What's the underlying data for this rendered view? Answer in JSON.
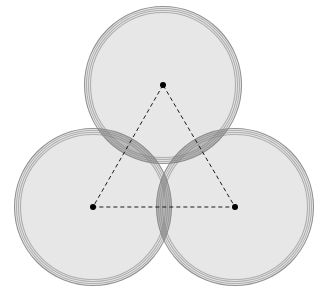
{
  "figure": {
    "type": "geometric-diagram",
    "canvas": {
      "width": 320,
      "height": 290,
      "background": "#ffffff"
    }
  },
  "style": {
    "circle_fill": "#d9d9d9",
    "circle_fill_opacity": 0.62,
    "circle_stroke": "#808080",
    "circle_stroke_width": 1.1,
    "overlap_shade": "#9a9a9a",
    "triangle_stroke": "#1a1a1a",
    "triangle_stroke_width": 1.0,
    "triangle_dash": "4 3",
    "vertex_dot_fill": "#000000",
    "vertex_dot_radius": 3.0
  },
  "chart_data": {
    "type": "scatter",
    "xlabel": "",
    "ylabel": "",
    "xlim": [
      0,
      320
    ],
    "ylim": [
      0,
      290
    ],
    "grid": false,
    "legend": "none",
    "circles": [
      {
        "name": "top-circle",
        "cx": 163,
        "cy": 85,
        "radii": [
          72.5,
          74.5,
          76.5,
          78.5
        ]
      },
      {
        "name": "left-circle",
        "cx": 93,
        "cy": 207,
        "radii": [
          72.5,
          74.5,
          76.5,
          78.5
        ]
      },
      {
        "name": "right-circle",
        "cx": 235,
        "cy": 207,
        "radii": [
          72.5,
          74.5,
          76.5,
          78.5
        ]
      }
    ],
    "triangle": {
      "name": "center-triangle",
      "vertices": [
        {
          "label": "top-center",
          "x": 163,
          "y": 85
        },
        {
          "label": "left-center",
          "x": 93,
          "y": 207
        },
        {
          "label": "right-center",
          "x": 235,
          "y": 207
        }
      ],
      "side_lengths": [
        141.0,
        141.0,
        142.0
      ],
      "closed": true,
      "dashed": true
    },
    "annotations": []
  }
}
